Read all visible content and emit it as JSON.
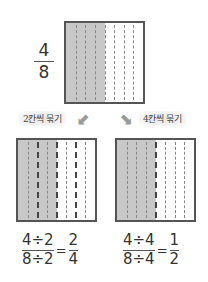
{
  "top": {
    "fraction": {
      "numerator": "4",
      "denominator": "8"
    },
    "grid": {
      "columns": 8,
      "shaded": 4
    }
  },
  "labels": {
    "left": "2칸씩 묶기",
    "right": "4칸씩 묶기"
  },
  "arrows": {
    "left": "⬋",
    "right": "⬊"
  },
  "bottom_left": {
    "grid": {
      "columns": 8,
      "shaded": 4,
      "group_size": 2
    },
    "equation": {
      "numerator": "4÷2",
      "denominator": "8÷2",
      "equals": "=",
      "result_numerator": "2",
      "result_denominator": "4"
    }
  },
  "bottom_right": {
    "grid": {
      "columns": 8,
      "shaded": 4,
      "group_size": 4
    },
    "equation": {
      "numerator": "4÷4",
      "denominator": "8÷4",
      "equals": "=",
      "result_numerator": "1",
      "result_denominator": "2"
    }
  },
  "colors": {
    "shade": "#c8c8c8",
    "border": "#555555",
    "arrow": "#9a9a9a"
  }
}
